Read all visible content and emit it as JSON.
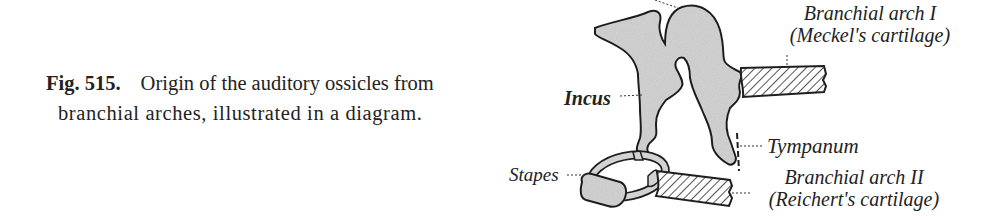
{
  "caption": {
    "figure_number": "Fig. 515.",
    "text_line1": "Origin of the auditory ossicles from",
    "text_line2": "branchial arches, illustrated in a diagram."
  },
  "diagram": {
    "labels": {
      "incus": "Incus",
      "stapes": "Stapes",
      "tympanum": "Tympanum",
      "arch1_title": "Branchial arch I",
      "arch1_sub": "(Meckel's cartilage)",
      "arch2_title": "Branchial arch II",
      "arch2_sub": "(Reichert's cartilage)"
    },
    "colors": {
      "bone_fill": "#d6d6d6",
      "outline": "#1f1f1f",
      "hatch": "#2a2a2a"
    }
  }
}
